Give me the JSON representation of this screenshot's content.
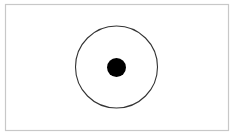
{
  "diagram": {
    "frame": {
      "x": 5.5,
      "y": 4.5,
      "width": 223,
      "height": 126,
      "stroke": "#c8c8c8",
      "fill": "#ffffff"
    },
    "ring": {
      "cx": 116.5,
      "cy": 67,
      "r": 41,
      "stroke": "#333333",
      "fill": "none"
    },
    "dot": {
      "cx": 116.5,
      "cy": 67.5,
      "r": 9.5,
      "fill": "#000000"
    }
  }
}
